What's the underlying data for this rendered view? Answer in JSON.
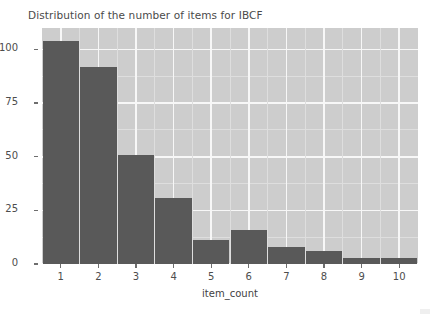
{
  "chart_data": {
    "type": "bar",
    "title": "Distribution of the number of items for IBCF",
    "xlabel": "item_count",
    "ylabel": "",
    "categories": [
      "1",
      "2",
      "3",
      "4",
      "5",
      "6",
      "7",
      "8",
      "9",
      "10"
    ],
    "values": [
      104,
      92,
      51,
      31,
      11,
      16,
      8,
      6,
      3,
      3
    ],
    "ylim": [
      0,
      110
    ],
    "y_ticks": [
      "0",
      "25",
      "50",
      "75",
      "100"
    ],
    "y_tick_values": [
      0,
      25,
      50,
      75,
      100
    ],
    "x_ticks": [
      "1",
      "2",
      "3",
      "4",
      "5",
      "6",
      "7",
      "8",
      "9",
      "10"
    ],
    "grid": true,
    "legend": "none",
    "colors": {
      "bar": "#595959",
      "panel_background": "#cdcdcd",
      "major_gridline": "#f7f7f7",
      "minor_gridline": "#dedede",
      "figure_background": "#ffffff",
      "text": "#4d4d4d"
    }
  }
}
